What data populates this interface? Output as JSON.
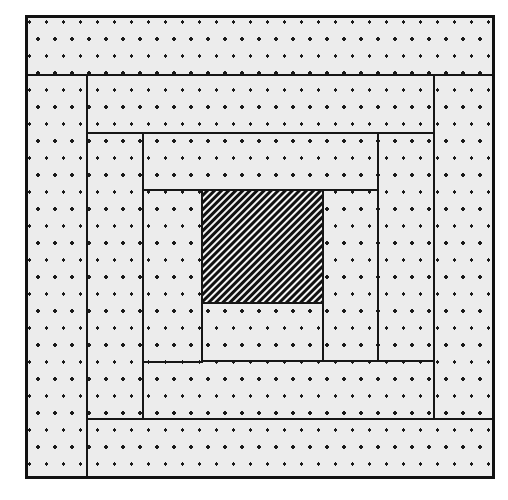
{
  "figure": {
    "kind": "nested-rectangle-spiral",
    "background_color": "#ffffff",
    "outline_color": "#161616",
    "frame": {
      "x": 26,
      "y": 16,
      "width": 467,
      "height": 461
    },
    "fills": {
      "dotted": {
        "name": "dotted-fill",
        "base_color": "#ececec",
        "dot_color": "#1a1a1a",
        "dot_radius": 1.7,
        "spacing_x": 17,
        "spacing_y": 17,
        "stagger": true
      },
      "hatched": {
        "name": "diagonal-hatch-fill",
        "base_color": "#ffffff",
        "line_color": "#111111",
        "angle_degrees": 45,
        "period": 5,
        "line_width": 2.6
      }
    },
    "center": {
      "name": "center-square",
      "fill": "hatched",
      "x": 202,
      "y": 190,
      "width": 121,
      "height": 113
    },
    "logs": [
      {
        "name": "log-01-right-of-center",
        "fill": "dotted",
        "x": 323,
        "y": 190,
        "width": 55,
        "height": 171
      },
      {
        "name": "log-02-below-center",
        "fill": "dotted",
        "x": 202,
        "y": 303,
        "width": 121,
        "height": 58
      },
      {
        "name": "log-03-left-inner",
        "fill": "dotted",
        "x": 143,
        "y": 190,
        "width": 59,
        "height": 172
      },
      {
        "name": "log-04-top-inner",
        "fill": "dotted",
        "x": 143,
        "y": 133,
        "width": 235,
        "height": 57
      },
      {
        "name": "log-05-right-mid",
        "fill": "dotted",
        "x": 378,
        "y": 133,
        "width": 56,
        "height": 228
      },
      {
        "name": "log-06-bottom-mid",
        "fill": "dotted",
        "x": 143,
        "y": 361,
        "width": 291,
        "height": 58
      },
      {
        "name": "log-07-left-mid",
        "fill": "dotted",
        "x": 87,
        "y": 133,
        "width": 56,
        "height": 286
      },
      {
        "name": "log-08-top-mid",
        "fill": "dotted",
        "x": 87,
        "y": 75,
        "width": 347,
        "height": 58
      },
      {
        "name": "log-09-right-outer",
        "fill": "dotted",
        "x": 434,
        "y": 75,
        "width": 59,
        "height": 344
      },
      {
        "name": "log-10-bottom-outer",
        "fill": "dotted",
        "x": 87,
        "y": 419,
        "width": 406,
        "height": 58
      },
      {
        "name": "log-11-left-outer",
        "fill": "dotted",
        "x": 26,
        "y": 75,
        "width": 61,
        "height": 402
      },
      {
        "name": "log-12-top-outer",
        "fill": "dotted",
        "x": 26,
        "y": 16,
        "width": 467,
        "height": 59
      }
    ]
  }
}
